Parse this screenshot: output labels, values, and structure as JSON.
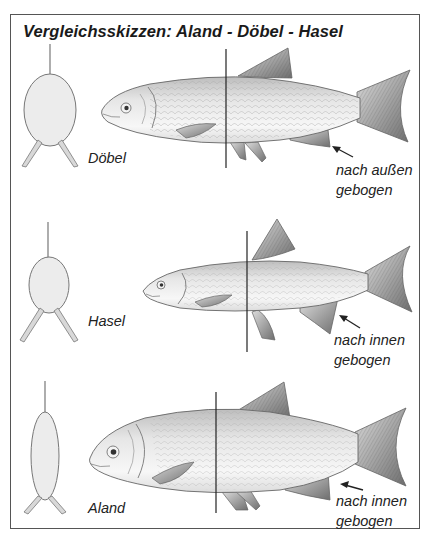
{
  "title": "Vergleichsskizzen: Aland - Döbel - Hasel",
  "panels": [
    {
      "species": "Döbel",
      "note_line1": "nach außen",
      "note_line2": "gebogen"
    },
    {
      "species": "Hasel",
      "note_line1": "nach innen",
      "note_line2": "gebogen"
    },
    {
      "species": "Aland",
      "note_line1": "nach innen",
      "note_line2": "gebogen"
    }
  ],
  "colors": {
    "border": "#555555",
    "text": "#1a1a1a",
    "fish_body": "#e8e8e8",
    "fin": "#8a8a8a",
    "cross_section": "#ebebeb"
  }
}
